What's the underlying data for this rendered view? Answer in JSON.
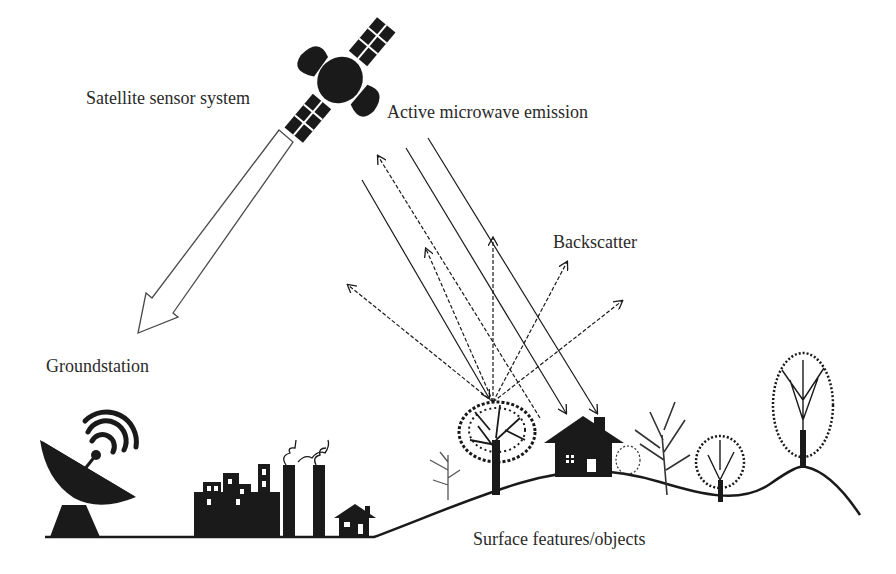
{
  "labels": {
    "satellite": "Satellite sensor system",
    "emission": "Active microwave emission",
    "backscatter": "Backscatter",
    "groundstation": "Groundstation",
    "surface": "Surface features/objects"
  },
  "icons": {
    "satellite": "satellite-icon",
    "downlink_arrow": "hollow-arrow-icon",
    "dish": "satellite-dish-icon",
    "factory": "factory-icon",
    "house": "house-icon",
    "trees": "tree-icon"
  },
  "colors": {
    "ink": "#1a1a1a",
    "text": "#2a2a2a",
    "background": "#ffffff"
  }
}
